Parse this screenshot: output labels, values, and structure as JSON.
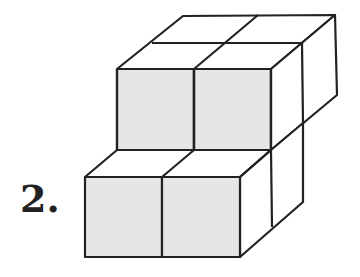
{
  "problem": {
    "number_label": "2."
  },
  "figure": {
    "front_face_color": "#e6e6e6",
    "side_face_color": "#ffffff",
    "line_color": "#222222"
  }
}
